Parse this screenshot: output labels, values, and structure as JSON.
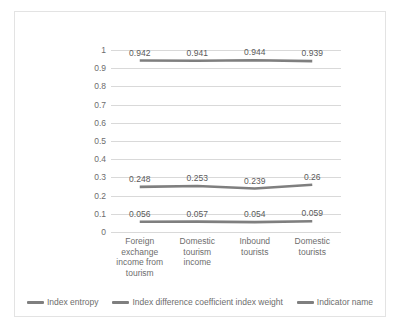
{
  "chart_data": {
    "type": "line",
    "title": "",
    "xlabel": "",
    "ylabel": "",
    "ylim": [
      0,
      1
    ],
    "ytick_labels": [
      "1",
      "0.9",
      "0.8",
      "0.7",
      "0.6",
      "0.5",
      "0.4",
      "0.3",
      "0.2",
      "0.1",
      "0"
    ],
    "ytick_values": [
      1,
      0.9,
      0.8,
      0.7,
      0.6,
      0.5,
      0.4,
      0.3,
      0.2,
      0.1,
      0
    ],
    "grid": true,
    "legend_position": "bottom",
    "categories": [
      "Foreign exchange income from tourism",
      "Domestic tourism income",
      "Inbound tourists",
      "Domestic tourists"
    ],
    "series": [
      {
        "name": "Index entropy",
        "color": "#7f7f7f",
        "values": [
          0.942,
          0.941,
          0.944,
          0.939
        ],
        "labels": [
          "0.942",
          "0.941",
          "0.944",
          "0.939"
        ]
      },
      {
        "name": "Index difference coefficient index weight",
        "color": "#7f7f7f",
        "values": [
          0.248,
          0.253,
          0.239,
          0.26
        ],
        "labels": [
          "0.248",
          "0.253",
          "0.239",
          "0.26"
        ]
      },
      {
        "name": "Indicator name",
        "color": "#7f7f7f",
        "values": [
          0.056,
          0.057,
          0.054,
          0.059
        ],
        "labels": [
          "0.056",
          "0.057",
          "0.054",
          "0.059"
        ]
      }
    ]
  },
  "colors": {
    "grid": "#d9d9d9",
    "text": "#6d6d6d",
    "border": "#e3e3e3",
    "line": "#7f7f7f"
  }
}
